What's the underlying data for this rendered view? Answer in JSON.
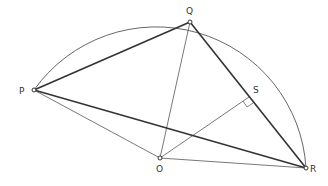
{
  "diagram": {
    "points": {
      "P": {
        "label": "P",
        "x": 34,
        "y": 90
      },
      "Q": {
        "label": "Q",
        "x": 190,
        "y": 22
      },
      "O": {
        "label": "O",
        "x": 160,
        "y": 158
      },
      "R": {
        "label": "R",
        "x": 306,
        "y": 168
      },
      "S": {
        "label": "S",
        "x": 249,
        "y": 97
      }
    },
    "colors": {
      "thick": "#333333",
      "thin": "#555555",
      "arc": "#555555"
    }
  }
}
